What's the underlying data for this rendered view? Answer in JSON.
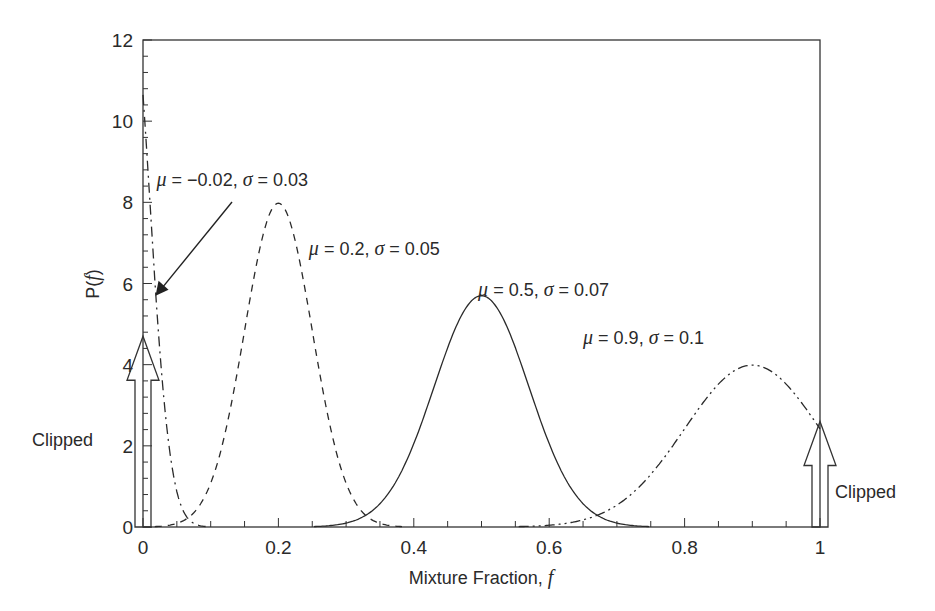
{
  "chart_data": {
    "type": "line",
    "title": "",
    "xlabel": "Mixture Fraction, f",
    "xlabel_main": "Mixture Fraction, ",
    "xlabel_var": "f",
    "ylabel": "P(f)",
    "ylabel_prefix": "P(",
    "ylabel_var": "f",
    "ylabel_suffix": ")",
    "xlim": [
      0,
      1
    ],
    "ylim": [
      0,
      12
    ],
    "x_ticks": [
      0,
      0.2,
      0.4,
      0.6,
      0.8,
      1
    ],
    "x_tick_labels": [
      "0",
      "0.2",
      "0.4",
      "0.6",
      "0.8",
      "1"
    ],
    "x_minor_step": 0.05,
    "y_ticks": [
      0,
      2,
      4,
      6,
      8,
      10,
      12
    ],
    "y_tick_labels": [
      "0",
      "2",
      "4",
      "6",
      "8",
      "10",
      "12"
    ],
    "y_minor_step": 0.4,
    "grid": false,
    "legend": "none (inline annotations)",
    "series": [
      {
        "name": "μ = −0.02, σ = 0.03",
        "mu": -0.02,
        "sigma": 0.03,
        "style": "dash-dot",
        "peak": 13.3,
        "points": [
          [
            0,
            10.0
          ],
          [
            0.02,
            5.8
          ],
          [
            0.04,
            1.8
          ],
          [
            0.06,
            0.3
          ],
          [
            0.08,
            0.02
          ]
        ]
      },
      {
        "name": "μ = 0.2, σ = 0.05",
        "mu": 0.2,
        "sigma": 0.05,
        "style": "dashed",
        "peak": 7.98,
        "points": [
          [
            0.05,
            0.09
          ],
          [
            0.1,
            1.08
          ],
          [
            0.15,
            4.84
          ],
          [
            0.2,
            7.98
          ],
          [
            0.25,
            4.84
          ],
          [
            0.3,
            1.08
          ],
          [
            0.35,
            0.09
          ]
        ]
      },
      {
        "name": "μ = 0.5, σ = 0.07",
        "mu": 0.5,
        "sigma": 0.07,
        "style": "solid",
        "peak": 5.7,
        "points": [
          [
            0.3,
            0.07
          ],
          [
            0.4,
            2.06
          ],
          [
            0.45,
            4.43
          ],
          [
            0.5,
            5.7
          ],
          [
            0.55,
            4.43
          ],
          [
            0.6,
            2.06
          ],
          [
            0.7,
            0.07
          ]
        ]
      },
      {
        "name": "μ = 0.9, σ = 0.1",
        "mu": 0.9,
        "sigma": 0.1,
        "style": "dash-dot-dot",
        "peak": 3.99,
        "points": [
          [
            0.6,
            0.04
          ],
          [
            0.7,
            0.54
          ],
          [
            0.8,
            2.42
          ],
          [
            0.9,
            3.99
          ],
          [
            1.0,
            2.42
          ]
        ]
      }
    ],
    "annotations": [
      {
        "text": "μ = −0.02, σ = 0.03",
        "mu_label": "μ",
        "rest": " = −0.02, ",
        "sig_label": "σ",
        "rest2": " = 0.03",
        "x": 0.02,
        "y": 8.4,
        "arrow_to": [
          0.02,
          5.7
        ]
      },
      {
        "text": "μ = 0.2, σ = 0.05",
        "mu_label": "μ",
        "rest": " = 0.2, ",
        "sig_label": "σ",
        "rest2": " = 0.05",
        "x": 0.245,
        "y": 6.7
      },
      {
        "text": "μ = 0.5, σ = 0.07",
        "mu_label": "μ",
        "rest": " = 0.5, ",
        "sig_label": "σ",
        "rest2": " = 0.07",
        "x": 0.495,
        "y": 5.7
      },
      {
        "text": "μ = 0.9, σ = 0.1",
        "mu_label": "μ",
        "rest": " = 0.9, ",
        "sig_label": "σ",
        "rest2": " = 0.1",
        "x": 0.65,
        "y": 4.5
      },
      {
        "text": "Clipped",
        "side": "left",
        "arrow_x": 0,
        "arrow_top": 4.7
      },
      {
        "text": "Clipped",
        "side": "right",
        "arrow_x": 1,
        "arrow_top": 2.6
      }
    ]
  }
}
